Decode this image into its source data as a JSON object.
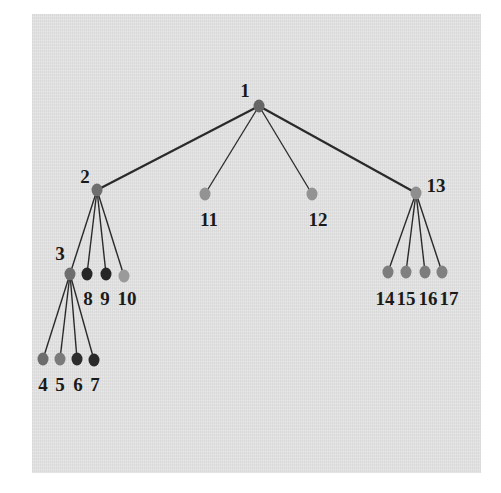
{
  "diagram": {
    "type": "tree",
    "background": "#e2e2e2",
    "nodes": [
      {
        "id": "1",
        "label": "1",
        "x": 259,
        "y": 106,
        "color": "#666666",
        "lx": 245,
        "ly": 97,
        "anchor": "middle"
      },
      {
        "id": "2",
        "label": "2",
        "x": 97,
        "y": 190,
        "color": "#6e6e6e",
        "lx": 85,
        "ly": 183,
        "anchor": "middle"
      },
      {
        "id": "3",
        "label": "3",
        "x": 70,
        "y": 274,
        "color": "#6e6e6e",
        "lx": 60,
        "ly": 260,
        "anchor": "middle"
      },
      {
        "id": "4",
        "label": "4",
        "x": 43,
        "y": 359,
        "color": "#6c6c6c",
        "lx": 43,
        "ly": 391,
        "anchor": "middle"
      },
      {
        "id": "5",
        "label": "5",
        "x": 60,
        "y": 359,
        "color": "#7a7a7a",
        "lx": 60,
        "ly": 391,
        "anchor": "middle"
      },
      {
        "id": "6",
        "label": "6",
        "x": 77,
        "y": 359,
        "color": "#2c2c2c",
        "lx": 78,
        "ly": 391,
        "anchor": "middle"
      },
      {
        "id": "7",
        "label": "7",
        "x": 94,
        "y": 360,
        "color": "#2a2a2a",
        "lx": 95,
        "ly": 391,
        "anchor": "middle"
      },
      {
        "id": "8",
        "label": "8",
        "x": 87,
        "y": 274,
        "color": "#262626",
        "lx": 88,
        "ly": 305,
        "anchor": "middle"
      },
      {
        "id": "9",
        "label": "9",
        "x": 106,
        "y": 274,
        "color": "#262626",
        "lx": 105,
        "ly": 305,
        "anchor": "middle"
      },
      {
        "id": "10",
        "label": "10",
        "x": 124,
        "y": 276,
        "color": "#9a9a9a",
        "lx": 127,
        "ly": 305,
        "anchor": "middle"
      },
      {
        "id": "11",
        "label": "11",
        "x": 205,
        "y": 194,
        "color": "#939393",
        "lx": 209,
        "ly": 226,
        "anchor": "middle"
      },
      {
        "id": "12",
        "label": "12",
        "x": 312,
        "y": 194,
        "color": "#939393",
        "lx": 318,
        "ly": 226,
        "anchor": "middle"
      },
      {
        "id": "13",
        "label": "13",
        "x": 416,
        "y": 193,
        "color": "#8e8e8e",
        "lx": 436,
        "ly": 192,
        "anchor": "middle"
      },
      {
        "id": "14",
        "label": "14",
        "x": 388,
        "y": 272,
        "color": "#7c7c7c",
        "lx": 385,
        "ly": 305,
        "anchor": "middle"
      },
      {
        "id": "15",
        "label": "15",
        "x": 406,
        "y": 272,
        "color": "#808080",
        "lx": 406,
        "ly": 305,
        "anchor": "middle"
      },
      {
        "id": "16",
        "label": "16",
        "x": 425,
        "y": 272,
        "color": "#7c7c7c",
        "lx": 428,
        "ly": 305,
        "anchor": "middle"
      },
      {
        "id": "17",
        "label": "17",
        "x": 442,
        "y": 272,
        "color": "#808080",
        "lx": 449,
        "ly": 305,
        "anchor": "middle"
      }
    ],
    "edges": [
      {
        "from": "1",
        "to": "2",
        "width": 2.2
      },
      {
        "from": "1",
        "to": "11",
        "width": 1.3
      },
      {
        "from": "1",
        "to": "12",
        "width": 1.3
      },
      {
        "from": "1",
        "to": "13",
        "width": 2.2
      },
      {
        "from": "2",
        "to": "3",
        "width": 1.4
      },
      {
        "from": "2",
        "to": "8",
        "width": 1.4
      },
      {
        "from": "2",
        "to": "9",
        "width": 1.4
      },
      {
        "from": "2",
        "to": "10",
        "width": 1.4
      },
      {
        "from": "3",
        "to": "4",
        "width": 1.4
      },
      {
        "from": "3",
        "to": "5",
        "width": 1.4
      },
      {
        "from": "3",
        "to": "6",
        "width": 1.4
      },
      {
        "from": "3",
        "to": "7",
        "width": 1.4
      },
      {
        "from": "13",
        "to": "14",
        "width": 1.4
      },
      {
        "from": "13",
        "to": "15",
        "width": 1.4
      },
      {
        "from": "13",
        "to": "16",
        "width": 1.4
      },
      {
        "from": "13",
        "to": "17",
        "width": 1.4
      }
    ]
  }
}
